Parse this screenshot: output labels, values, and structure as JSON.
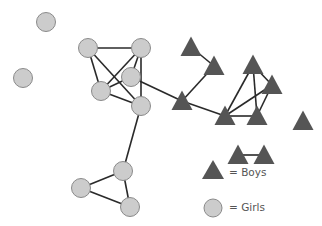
{
  "diagram": {
    "type": "social-network",
    "colors": {
      "boy_fill": "#555555",
      "girl_fill": "#cccccc",
      "girl_stroke": "#8a8a8a",
      "edge": "#2a2a2a"
    },
    "nodes": [
      {
        "id": "g1",
        "kind": "girl",
        "x": 46,
        "y": 22
      },
      {
        "id": "g2",
        "kind": "girl",
        "x": 23,
        "y": 78
      },
      {
        "id": "g3",
        "kind": "girl",
        "x": 88,
        "y": 48
      },
      {
        "id": "g4",
        "kind": "girl",
        "x": 141,
        "y": 48
      },
      {
        "id": "g5",
        "kind": "girl",
        "x": 131,
        "y": 77
      },
      {
        "id": "g6",
        "kind": "girl",
        "x": 101,
        "y": 91
      },
      {
        "id": "g7",
        "kind": "girl",
        "x": 141,
        "y": 106
      },
      {
        "id": "g8",
        "kind": "girl",
        "x": 123,
        "y": 171
      },
      {
        "id": "g9",
        "kind": "girl",
        "x": 81,
        "y": 188
      },
      {
        "id": "g10",
        "kind": "girl",
        "x": 130,
        "y": 207
      },
      {
        "id": "b1",
        "kind": "boy",
        "x": 191,
        "y": 47
      },
      {
        "id": "b2",
        "kind": "boy",
        "x": 214,
        "y": 66
      },
      {
        "id": "b3",
        "kind": "boy",
        "x": 182,
        "y": 101
      },
      {
        "id": "b4",
        "kind": "boy",
        "x": 225,
        "y": 116
      },
      {
        "id": "b5",
        "kind": "boy",
        "x": 253,
        "y": 65
      },
      {
        "id": "b6",
        "kind": "boy",
        "x": 272,
        "y": 85
      },
      {
        "id": "b7",
        "kind": "boy",
        "x": 257,
        "y": 116
      },
      {
        "id": "b8",
        "kind": "boy",
        "x": 303,
        "y": 121
      },
      {
        "id": "b9",
        "kind": "boy",
        "x": 238,
        "y": 155
      },
      {
        "id": "b10",
        "kind": "boy",
        "x": 264,
        "y": 155
      }
    ],
    "edges": [
      [
        "g3",
        "g4"
      ],
      [
        "g3",
        "g6"
      ],
      [
        "g3",
        "g7"
      ],
      [
        "g4",
        "g5"
      ],
      [
        "g4",
        "g6"
      ],
      [
        "g4",
        "g7"
      ],
      [
        "g5",
        "g6"
      ],
      [
        "g6",
        "g7"
      ],
      [
        "g5",
        "b3"
      ],
      [
        "g7",
        "g8"
      ],
      [
        "g8",
        "g9"
      ],
      [
        "g8",
        "g10"
      ],
      [
        "g9",
        "g10"
      ],
      [
        "b1",
        "b2"
      ],
      [
        "b2",
        "b3"
      ],
      [
        "b3",
        "b4"
      ],
      [
        "b4",
        "b5"
      ],
      [
        "b4",
        "b6"
      ],
      [
        "b4",
        "b7"
      ],
      [
        "b5",
        "b6"
      ],
      [
        "b5",
        "b7"
      ],
      [
        "b6",
        "b7"
      ],
      [
        "b9",
        "b10"
      ]
    ]
  },
  "legend": {
    "items": [
      {
        "symbol": "triangle",
        "label": "= Boys"
      },
      {
        "symbol": "circle",
        "label": "= Girls"
      }
    ]
  }
}
